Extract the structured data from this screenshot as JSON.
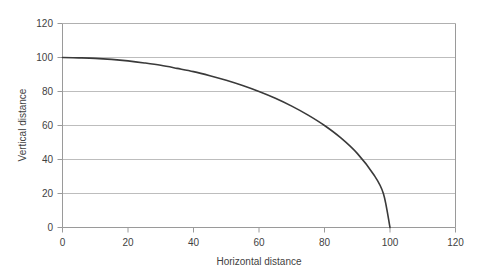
{
  "chart_data": {
    "type": "line",
    "title": "",
    "subtitle": "",
    "xlabel": "Horizontal distance",
    "ylabel": "Vertical distance",
    "xlim": [
      0,
      120
    ],
    "ylim": [
      0,
      120
    ],
    "xticks": [
      0,
      20,
      40,
      60,
      80,
      100,
      120
    ],
    "yticks": [
      0,
      20,
      40,
      60,
      80,
      100,
      120
    ],
    "xtick_labels": [
      "0",
      "20",
      "40",
      "60",
      "80",
      "100",
      "120"
    ],
    "ytick_labels": [
      "0",
      "20",
      "40",
      "60",
      "80",
      "100",
      "120"
    ],
    "grid": "horizontal",
    "legend": "none",
    "series": [
      {
        "name": "trajectory",
        "color": "#3a3a3a",
        "x": [
          0,
          5,
          10,
          15,
          20,
          25,
          30,
          35,
          40,
          45,
          50,
          55,
          60,
          65,
          70,
          75,
          80,
          85,
          90,
          95,
          98,
          100
        ],
        "y": [
          100,
          99.8,
          99.5,
          98.9,
          98.0,
          96.8,
          95.4,
          93.6,
          91.7,
          89.3,
          86.6,
          83.5,
          80.0,
          76.0,
          71.4,
          66.1,
          60.0,
          52.7,
          43.6,
          31.2,
          19.9,
          0
        ]
      }
    ]
  },
  "axes": {
    "x_axis_title": "Horizontal distance",
    "y_axis_title": "Vertical distance"
  }
}
